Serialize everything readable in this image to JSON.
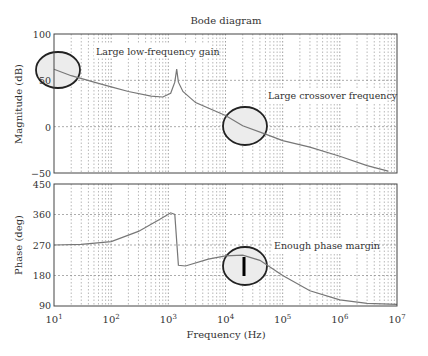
{
  "chart_data": [
    {
      "type": "line",
      "title": "Bode diagram",
      "xlabel": "Frequency (Hz)",
      "ylabel": "Magnitude (dB)",
      "xscale": "log",
      "xlim": [
        10,
        10000000
      ],
      "ylim": [
        -50,
        100
      ],
      "yticks": [
        "100",
        "50",
        "0",
        "-50"
      ],
      "grid": true,
      "series": [
        {
          "name": "Magnitude",
          "x": [
            10,
            20,
            50,
            100,
            200,
            500,
            800,
            1100,
            1300,
            1400,
            1500,
            1800,
            3000,
            10000,
            20000,
            50000,
            100000,
            300000,
            1000000,
            3000000,
            7000000
          ],
          "values": [
            62,
            55,
            48,
            43,
            38,
            33,
            32,
            36,
            48,
            62,
            48,
            38,
            26,
            12,
            1,
            -8,
            -15,
            -22,
            -32,
            -42,
            -48
          ]
        }
      ],
      "annotations": [
        {
          "text": "Large low-frequency gain",
          "ellipse_center": [
            14,
            60
          ]
        },
        {
          "text": "Large crossover frequency",
          "ellipse_center": [
            20000,
            0
          ]
        }
      ]
    },
    {
      "type": "line",
      "xlabel": "Frequency (Hz)",
      "ylabel": "Phase (deg)",
      "xscale": "log",
      "xlim": [
        10,
        10000000
      ],
      "ylim": [
        90,
        450
      ],
      "yticks": [
        "450",
        "360",
        "270",
        "180",
        "90"
      ],
      "grid": true,
      "series": [
        {
          "name": "Phase",
          "x": [
            10,
            30,
            100,
            300,
            700,
            1100,
            1300,
            1500,
            2000,
            5000,
            10000,
            20000,
            40000,
            100000,
            300000,
            1000000,
            3000000,
            10000000
          ],
          "values": [
            270,
            272,
            280,
            310,
            345,
            365,
            360,
            210,
            208,
            228,
            238,
            240,
            225,
            180,
            135,
            108,
            98,
            95
          ]
        }
      ],
      "annotations": [
        {
          "text": "Enough phase margin",
          "ellipse_center": [
            20000,
            225
          ]
        }
      ]
    }
  ],
  "labels": {
    "title": "Bode diagram",
    "mag_ylabel": "Magnitude (dB)",
    "phase_ylabel": "Phase (deg)",
    "xlabel": "Frequency (Hz)",
    "ann_low_freq": "Large low-frequency gain",
    "ann_crossover": "Large crossover frequency",
    "ann_phase_margin": "Enough phase margin",
    "mag_ticks": [
      "100",
      "50",
      "0",
      "−50"
    ],
    "phase_ticks": [
      "450",
      "360",
      "270",
      "180",
      "90"
    ],
    "x_ticks_exp": [
      "1",
      "2",
      "3",
      "4",
      "5",
      "6",
      "7"
    ]
  }
}
